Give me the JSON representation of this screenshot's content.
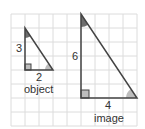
{
  "diagram": {
    "grid": {
      "color": "#d9d9d9",
      "cell": 14
    },
    "object": {
      "label": "object",
      "height_label": "3",
      "base_label": "2"
    },
    "image": {
      "label": "image",
      "height_label": "6",
      "base_label": "4"
    },
    "colors": {
      "line": "#444444",
      "apex_angle": "#666666",
      "base_angle": "#bbbbbb",
      "right_angle": "#bbbbbb"
    }
  }
}
